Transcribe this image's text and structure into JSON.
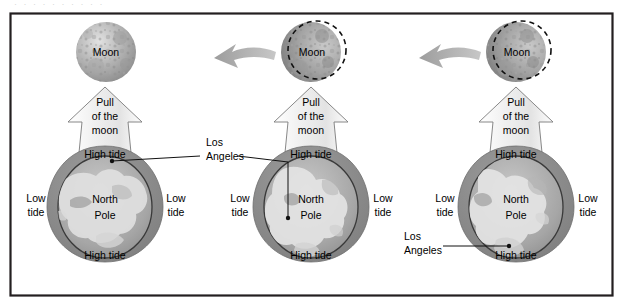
{
  "figure": {
    "title_faint": "· · · · · · · · · ·",
    "frame_color": "#231f20",
    "background": "#ffffff",
    "tide_ring_color": "#8b8b8b",
    "ocean_color": "#9a9a9a",
    "land_color": "#d9d9d9",
    "arrow_fill": "#f2f2f2",
    "arrow_outline": "#6e6e6e",
    "motion_arrow_color": "#a8a8a8",
    "moon_color": "#b4b4b4"
  },
  "panels": [
    {
      "id": "panel-1",
      "moon_label": "Moon",
      "has_dashed_moon_outline": false,
      "has_motion_arrow": false,
      "pull_label_lines": [
        "Pull",
        "of the",
        "moon"
      ],
      "tide_top_label": "High tide",
      "tide_bottom_label": "High tide",
      "tide_left_lines": [
        "Low",
        "tide"
      ],
      "tide_right_lines": [
        "Low",
        "tide"
      ],
      "earth_label_lines": [
        "North",
        "Pole"
      ],
      "la_label_lines": [
        "Los",
        "Angeles"
      ],
      "la_label_position": "right-of-panel",
      "la_marker": "top-of-globe"
    },
    {
      "id": "panel-2",
      "moon_label": "Moon",
      "has_dashed_moon_outline": true,
      "has_motion_arrow": true,
      "pull_label_lines": [
        "Pull",
        "of the",
        "moon"
      ],
      "tide_top_label": "High tide",
      "tide_bottom_label": "High tide",
      "tide_left_lines": [
        "Low",
        "tide"
      ],
      "tide_right_lines": [
        "Low",
        "tide"
      ],
      "earth_label_lines": [
        "North",
        "Pole"
      ],
      "la_label_lines": [
        "Los",
        "Angeles"
      ],
      "la_label_position": "left-of-panel",
      "la_marker": "left-of-globe"
    },
    {
      "id": "panel-3",
      "moon_label": "Moon",
      "has_dashed_moon_outline": true,
      "has_motion_arrow": true,
      "pull_label_lines": [
        "Pull",
        "of the",
        "moon"
      ],
      "tide_top_label": "High tide",
      "tide_bottom_label": "High tide",
      "tide_left_lines": [
        "Low",
        "tide"
      ],
      "tide_right_lines": [
        "Low",
        "tide"
      ],
      "earth_label_lines": [
        "North",
        "Pole"
      ],
      "la_label_lines": [
        "Los",
        "Angeles"
      ],
      "la_label_position": "lower-left-of-panel",
      "la_marker": "bottom-left-of-globe"
    }
  ]
}
